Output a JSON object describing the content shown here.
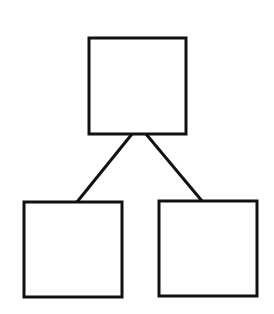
{
  "diagram": {
    "type": "tree",
    "canvas": {
      "width": 274,
      "height": 314,
      "background": "#ffffff"
    },
    "stroke": {
      "color": "#111111",
      "width": 3
    },
    "nodes": [
      {
        "id": "root",
        "label": "",
        "x": 89,
        "y": 38,
        "w": 97,
        "h": 96
      },
      {
        "id": "left-child",
        "label": "",
        "x": 24,
        "y": 202,
        "w": 98,
        "h": 95
      },
      {
        "id": "right-child",
        "label": "",
        "x": 159,
        "y": 201,
        "w": 98,
        "h": 95
      }
    ],
    "edges": [
      {
        "from": "root",
        "to": "left-child",
        "x1": 132,
        "y1": 134,
        "x2": 77,
        "y2": 202
      },
      {
        "from": "root",
        "to": "right-child",
        "x1": 146,
        "y1": 134,
        "x2": 202,
        "y2": 201
      }
    ]
  }
}
